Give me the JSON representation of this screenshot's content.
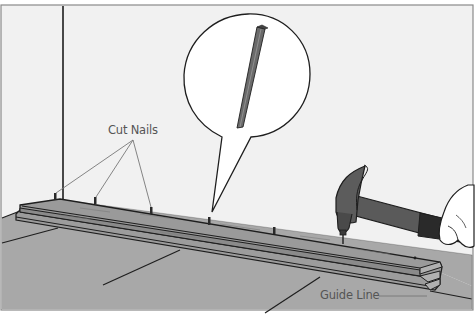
{
  "illustration": {
    "subject": "Installing starter board with cut nails along guide line",
    "labels": {
      "cut_nails": "Cut Nails",
      "guide_line": "Guide Line"
    },
    "callout": {
      "content": "cut-nail-closeup"
    },
    "colors": {
      "wall": "#f1f1f1",
      "floor": "#a8a8a8",
      "board_top": "#9a9a9a",
      "board_edge": "#8a8a8a",
      "outline": "#1e1e1e",
      "callout_fill": "#ffffff",
      "label_text": "#555555",
      "leader_line": "#777777"
    }
  }
}
